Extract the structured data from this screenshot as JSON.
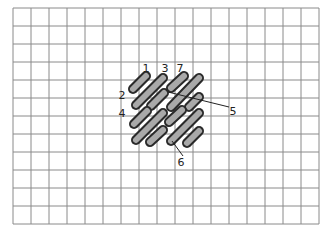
{
  "diagram": {
    "grid": {
      "x0": 13,
      "y0": 8,
      "cell": 18,
      "cols": 17,
      "rows": 12,
      "line_color": "#8a8a8a"
    },
    "stitch_fill": "#a9a9a9",
    "stitch_stroke": "#2a2a2a",
    "stitches": [
      {
        "x1": 133,
        "y1": 89,
        "x2": 146,
        "y2": 76
      },
      {
        "x1": 136,
        "y1": 105,
        "x2": 163,
        "y2": 78
      },
      {
        "x1": 171,
        "y1": 88,
        "x2": 184,
        "y2": 76
      },
      {
        "x1": 171,
        "y1": 107,
        "x2": 199,
        "y2": 78
      },
      {
        "x1": 151,
        "y1": 106,
        "x2": 164,
        "y2": 93
      },
      {
        "x1": 189,
        "y1": 107,
        "x2": 199,
        "y2": 97
      },
      {
        "x1": 134,
        "y1": 124,
        "x2": 147,
        "y2": 111
      },
      {
        "x1": 136,
        "y1": 140,
        "x2": 163,
        "y2": 113
      },
      {
        "x1": 169,
        "y1": 122,
        "x2": 182,
        "y2": 110
      },
      {
        "x1": 171,
        "y1": 141,
        "x2": 199,
        "y2": 113
      },
      {
        "x1": 150,
        "y1": 142,
        "x2": 163,
        "y2": 130
      },
      {
        "x1": 187,
        "y1": 143,
        "x2": 199,
        "y2": 131
      }
    ],
    "labels": [
      {
        "text": "1",
        "x": 146,
        "y": 72
      },
      {
        "text": "3",
        "x": 165,
        "y": 72
      },
      {
        "text": "7",
        "x": 180,
        "y": 72
      },
      {
        "text": "2",
        "x": 122,
        "y": 99
      },
      {
        "text": "4",
        "x": 122,
        "y": 117
      },
      {
        "text": "5",
        "x": 233,
        "y": 115
      },
      {
        "text": "6",
        "x": 181,
        "y": 166
      }
    ],
    "leaders": [
      {
        "x1": 168,
        "y1": 92,
        "x2": 229,
        "y2": 107
      },
      {
        "x1": 172,
        "y1": 141,
        "x2": 183,
        "y2": 156
      }
    ]
  }
}
